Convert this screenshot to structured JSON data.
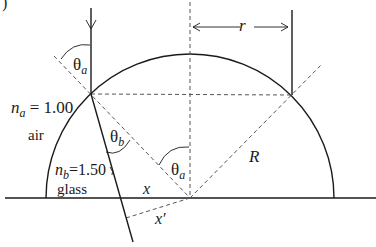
{
  "figure": {
    "corner_label": ")",
    "labels": {
      "theta_a_top": {
        "sym": "θ",
        "sub": "a"
      },
      "theta_b": {
        "sym": "θ",
        "sub": "b"
      },
      "theta_a_center": {
        "sym": "θ",
        "sub": "a"
      },
      "n_a": {
        "sym": "n",
        "sub": "a",
        "value": " = 1.00"
      },
      "n_b": {
        "sym": "n",
        "sub": "b",
        "value": "=1.50"
      },
      "air": "air",
      "glass": "glass",
      "r": "r",
      "R": "R",
      "x": "x",
      "x_prime": "x′"
    },
    "geometry": {
      "center": [
        190,
        198
      ],
      "radius": 144,
      "incident_point_left": [
        91,
        94
      ],
      "incident_point_right": [
        292,
        95
      ],
      "refracted_ray_end": [
        133,
        242
      ]
    },
    "colors": {
      "line": "#1a1a1a",
      "dashed": "#555555",
      "background": "#ffffff"
    }
  }
}
